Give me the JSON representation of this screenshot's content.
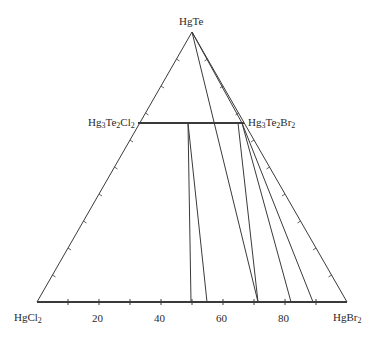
{
  "diagram": {
    "type": "ternary-phase-diagram",
    "vertices": {
      "top": {
        "label": "HgTe",
        "base": "HgTe",
        "sub": ""
      },
      "left": {
        "label": "HgCl2",
        "base": "HgCl",
        "sub": "2"
      },
      "right": {
        "label": "HgBr2",
        "base": "HgBr",
        "sub": "2"
      }
    },
    "intermediate_phases": {
      "left": {
        "label": "Hg3Te2Cl2",
        "parts": [
          "Hg",
          "3",
          "Te",
          "2",
          "Cl",
          "2"
        ]
      },
      "right": {
        "label": "Hg3Te2Br2",
        "parts": [
          "Hg",
          "3",
          "Te",
          "2",
          "Br",
          "2"
        ]
      }
    },
    "axis_ticks": [
      "20",
      "40",
      "60",
      "80"
    ],
    "tie_lines_base_endpoints_percent": [
      50,
      55,
      71,
      82,
      89
    ],
    "line_color": "#3a3a3a"
  }
}
